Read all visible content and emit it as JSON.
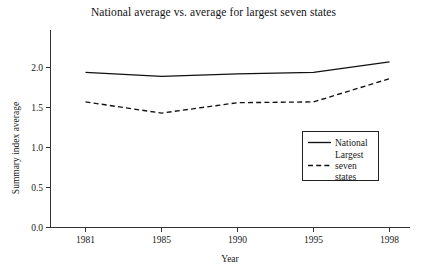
{
  "chart_data": {
    "type": "line",
    "title": "National average vs. average for largest seven states",
    "xlabel": "Year",
    "ylabel": "Summary index average",
    "categories": [
      "1981",
      "1985",
      "1990",
      "1995",
      "1998"
    ],
    "x": [
      1981,
      1985,
      1990,
      1995,
      1998
    ],
    "xlim": [
      1980,
      1999
    ],
    "ylim": [
      0.0,
      2.3
    ],
    "yticks": [
      "0.0",
      "0.5",
      "1.0",
      "1.5",
      "2.0"
    ],
    "ytick_values": [
      0.0,
      0.5,
      1.0,
      1.5,
      2.0
    ],
    "xticks": [
      "1981",
      "1985",
      "1990",
      "1995",
      "1998"
    ],
    "grid": false,
    "legend_position": "inside-right-middle",
    "series": [
      {
        "name": "National",
        "style": "solid",
        "values": [
          1.94,
          1.89,
          1.92,
          1.94,
          2.07
        ]
      },
      {
        "name": "Largest seven states",
        "style": "dashed",
        "values": [
          1.57,
          1.43,
          1.56,
          1.57,
          1.86
        ]
      }
    ],
    "legend": [
      {
        "label": "National",
        "style": "solid"
      },
      {
        "label_line1": "Largest",
        "label_line2": "seven",
        "label_line3": "states",
        "style": "dashed"
      }
    ],
    "colors": {
      "series_stroke": "#111111",
      "axis": "#333333",
      "background": "#ffffff",
      "text": "#181818"
    }
  }
}
